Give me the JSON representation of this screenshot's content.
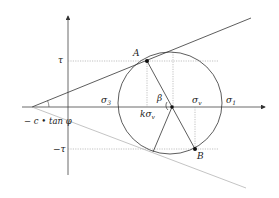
{
  "diagram": {
    "type": "Mohr circle with Mohr-Coulomb failure envelope",
    "labels": {
      "tau": "τ",
      "neg_tau": "−τ",
      "point_a": "A",
      "point_b": "B",
      "sigma3": "σ",
      "sigma3_sub": "3",
      "sigma1": "σ",
      "sigma1_sub": "1",
      "sigma_v": "σ",
      "sigma_v_sub": "v",
      "k_sigma_v": "kσ",
      "k_sigma_v_sub": "v",
      "beta": "β",
      "intercept": "− c • tan φ"
    },
    "colors": {
      "line": "#333333",
      "light_line": "#999999",
      "dotted": "#888888"
    }
  }
}
